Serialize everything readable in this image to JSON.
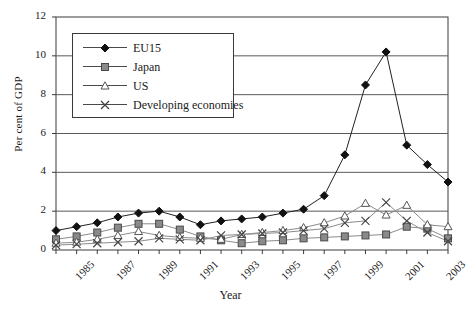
{
  "chart_data": {
    "type": "line",
    "title": "",
    "xlabel": "Year",
    "ylabel": "Per cent of GDP",
    "xlim": [
      1985,
      2004
    ],
    "ylim": [
      0,
      12
    ],
    "yticks": [
      0,
      2,
      4,
      6,
      8,
      10,
      12
    ],
    "xticks": [
      1985,
      1987,
      1989,
      1991,
      1993,
      1995,
      1997,
      1999,
      2001,
      2003
    ],
    "xtick_labels": [
      "1985",
      "1987",
      "1989",
      "1991",
      "1993",
      "1995",
      "1997",
      "1999",
      "2001",
      "2003"
    ],
    "grid": "horizontal",
    "legend_position": "top-left",
    "x": [
      1985,
      1986,
      1987,
      1988,
      1989,
      1990,
      1991,
      1992,
      1993,
      1994,
      1995,
      1996,
      1997,
      1998,
      1999,
      2000,
      2001,
      2002,
      2003,
      2004
    ],
    "series": [
      {
        "name": "EU15",
        "marker": "filled-diamond",
        "color": "#1a1a1a",
        "values": [
          1.0,
          1.2,
          1.4,
          1.7,
          1.9,
          2.0,
          1.7,
          1.3,
          1.5,
          1.6,
          1.7,
          1.9,
          2.1,
          2.8,
          4.9,
          8.5,
          10.2,
          5.4,
          4.4,
          3.5
        ]
      },
      {
        "name": "Japan",
        "marker": "filled-square",
        "color": "#6e6e6e",
        "values": [
          0.55,
          0.7,
          0.9,
          1.15,
          1.35,
          1.35,
          1.05,
          0.7,
          0.5,
          0.35,
          0.45,
          0.5,
          0.6,
          0.65,
          0.7,
          0.75,
          0.8,
          1.2,
          1.1,
          0.6
        ]
      },
      {
        "name": "US",
        "marker": "open-triangle",
        "color": "#7a7a7a",
        "values": [
          0.35,
          0.4,
          0.55,
          0.75,
          0.95,
          0.75,
          0.65,
          0.6,
          0.55,
          0.8,
          0.9,
          1.0,
          1.15,
          1.4,
          1.75,
          2.4,
          1.8,
          2.3,
          1.3,
          1.2
        ]
      },
      {
        "name": "Developing economies",
        "marker": "cross",
        "color": "#6a6a6a",
        "values": [
          0.25,
          0.3,
          0.35,
          0.4,
          0.45,
          0.6,
          0.55,
          0.5,
          0.75,
          0.8,
          0.85,
          0.9,
          1.0,
          1.1,
          1.4,
          1.5,
          2.45,
          1.5,
          0.9,
          0.45
        ]
      }
    ]
  },
  "legend": {
    "items": [
      {
        "label": "EU15"
      },
      {
        "label": "Japan"
      },
      {
        "label": "US"
      },
      {
        "label": "Developing economies"
      }
    ]
  },
  "axis": {
    "y_title": "Per cent of GDP",
    "x_title": "Year"
  }
}
